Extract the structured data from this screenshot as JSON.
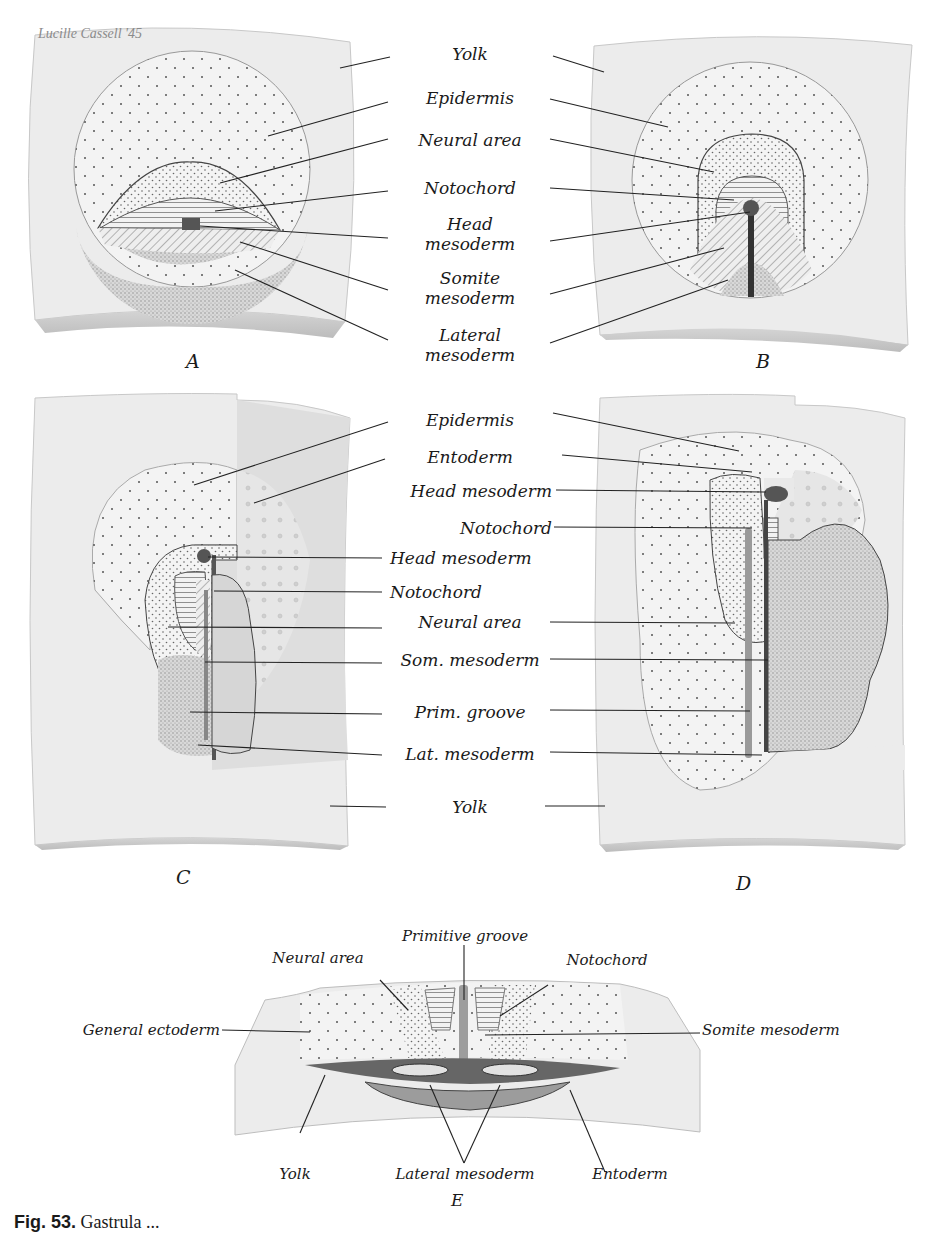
{
  "signature": "Lucille Cassell '45",
  "panels": {
    "A": {
      "letter": "A"
    },
    "B": {
      "letter": "B"
    },
    "C": {
      "letter": "C"
    },
    "D": {
      "letter": "D"
    },
    "E": {
      "letter": "E"
    }
  },
  "labels_ab": [
    {
      "line1": "Yolk",
      "line2": ""
    },
    {
      "line1": "Epidermis",
      "line2": ""
    },
    {
      "line1": "Neural area",
      "line2": ""
    },
    {
      "line1": "Notochord",
      "line2": ""
    },
    {
      "line1": "Head",
      "line2": "mesoderm"
    },
    {
      "line1": "Somite",
      "line2": "mesoderm"
    },
    {
      "line1": "Lateral",
      "line2": "mesoderm"
    }
  ],
  "labels_cd": [
    "Epidermis",
    "Entoderm",
    "Head mesoderm",
    "Notochord",
    "Head mesoderm",
    "Notochord",
    "Neural area",
    "Som. mesoderm",
    "Prim. groove",
    "Lat. mesoderm",
    "Yolk"
  ],
  "labels_e": {
    "primitive_groove": "Primitive groove",
    "neural_area": "Neural area",
    "notochord": "Notochord",
    "general_ectoderm": "General ectoderm",
    "somite_mesoderm": "Somite mesoderm",
    "yolk": "Yolk",
    "lateral_mesoderm": "Lateral mesoderm",
    "entoderm": "Entoderm"
  },
  "caption": {
    "fig_number": "Fig. 53.",
    "text": "Gastrula ..."
  }
}
